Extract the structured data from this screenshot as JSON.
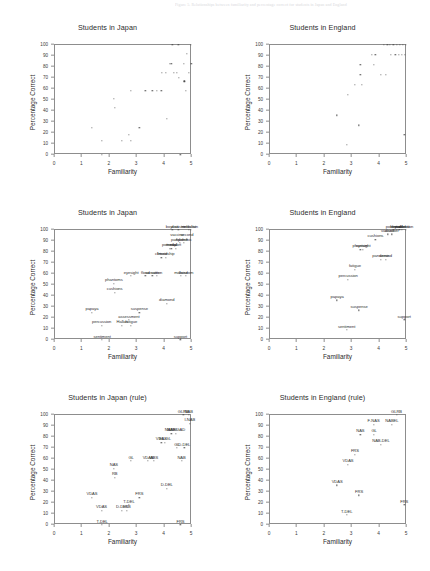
{
  "document": {
    "header_line": "Figure 5.  Relationships between familiarity and percentage correct for students in Japan and England"
  },
  "axes": {
    "xlabel": "Familiarity",
    "ylabel": "Percentage Correct",
    "xticks": [
      "0",
      "1",
      "2",
      "3",
      "4",
      "5"
    ],
    "yticks": [
      "0",
      "10",
      "20",
      "30",
      "40",
      "50",
      "60",
      "70",
      "80",
      "90",
      "100"
    ],
    "xlim": [
      0,
      5
    ],
    "ylim": [
      0,
      100
    ]
  },
  "chart_data": [
    {
      "id": "japan-plain",
      "type": "scatter",
      "title": "Students in Japan",
      "xlabel": "Familiarity",
      "ylabel": "Percentage Correct",
      "xlim": [
        0,
        5
      ],
      "ylim": [
        0,
        100
      ],
      "grid": false,
      "points": [
        {
          "x": 1.35,
          "y": 25
        },
        {
          "x": 1.7,
          "y": 13
        },
        {
          "x": 1.72,
          "y": 0
        },
        {
          "x": 2.15,
          "y": 51
        },
        {
          "x": 2.18,
          "y": 43
        },
        {
          "x": 2.45,
          "y": 13
        },
        {
          "x": 2.7,
          "y": 18
        },
        {
          "x": 2.78,
          "y": 13
        },
        {
          "x": 2.78,
          "y": 58
        },
        {
          "x": 3.08,
          "y": 25
        },
        {
          "x": 3.3,
          "y": 58
        },
        {
          "x": 3.55,
          "y": 58
        },
        {
          "x": 3.72,
          "y": 58
        },
        {
          "x": 3.88,
          "y": 58
        },
        {
          "x": 3.9,
          "y": 75
        },
        {
          "x": 4.05,
          "y": 75
        },
        {
          "x": 4.08,
          "y": 33
        },
        {
          "x": 4.18,
          "y": 83
        },
        {
          "x": 4.25,
          "y": 83
        },
        {
          "x": 4.28,
          "y": 100
        },
        {
          "x": 4.35,
          "y": 75
        },
        {
          "x": 4.45,
          "y": 75
        },
        {
          "x": 4.5,
          "y": 100
        },
        {
          "x": 4.52,
          "y": 70
        },
        {
          "x": 4.58,
          "y": 0
        },
        {
          "x": 4.7,
          "y": 83
        },
        {
          "x": 4.72,
          "y": 67
        },
        {
          "x": 4.78,
          "y": 58
        },
        {
          "x": 4.82,
          "y": 92
        },
        {
          "x": 4.88,
          "y": 75
        },
        {
          "x": 4.95,
          "y": 100
        },
        {
          "x": 4.98,
          "y": 83
        }
      ]
    },
    {
      "id": "england-plain",
      "type": "scatter",
      "title": "Students in England",
      "xlabel": "Familiarity",
      "ylabel": "Percentage Correct",
      "xlim": [
        0,
        5
      ],
      "ylim": [
        0,
        100
      ],
      "grid": false,
      "points": [
        {
          "x": 2.45,
          "y": 36
        },
        {
          "x": 2.8,
          "y": 9
        },
        {
          "x": 2.85,
          "y": 55
        },
        {
          "x": 3.1,
          "y": 64
        },
        {
          "x": 3.25,
          "y": 27
        },
        {
          "x": 3.3,
          "y": 82
        },
        {
          "x": 3.3,
          "y": 73
        },
        {
          "x": 3.35,
          "y": 64
        },
        {
          "x": 3.72,
          "y": 91
        },
        {
          "x": 3.78,
          "y": 82
        },
        {
          "x": 3.85,
          "y": 91
        },
        {
          "x": 4.05,
          "y": 73
        },
        {
          "x": 4.15,
          "y": 100
        },
        {
          "x": 4.22,
          "y": 73
        },
        {
          "x": 4.28,
          "y": 100
        },
        {
          "x": 4.38,
          "y": 100
        },
        {
          "x": 4.42,
          "y": 91
        },
        {
          "x": 4.5,
          "y": 100
        },
        {
          "x": 4.58,
          "y": 91
        },
        {
          "x": 4.62,
          "y": 100
        },
        {
          "x": 4.7,
          "y": 91
        },
        {
          "x": 4.75,
          "y": 100
        },
        {
          "x": 4.8,
          "y": 91
        },
        {
          "x": 4.85,
          "y": 100
        },
        {
          "x": 4.9,
          "y": 18
        },
        {
          "x": 4.92,
          "y": 91
        },
        {
          "x": 4.96,
          "y": 100
        }
      ]
    },
    {
      "id": "japan-words",
      "type": "scatter",
      "title": "Students in Japan",
      "xlabel": "Familiarity",
      "ylabel": "Percentage Correct",
      "xlim": [
        0,
        5
      ],
      "ylim": [
        0,
        100
      ],
      "grid": false,
      "points": [
        {
          "x": 1.35,
          "y": 25,
          "label": "papaya"
        },
        {
          "x": 1.7,
          "y": 13,
          "label": "percussion"
        },
        {
          "x": 1.72,
          "y": 0,
          "label": "sentiment"
        },
        {
          "x": 2.15,
          "y": 51,
          "label": "phantoms"
        },
        {
          "x": 2.18,
          "y": 43,
          "label": "cushions"
        },
        {
          "x": 2.45,
          "y": 13,
          "label": "Hallari"
        },
        {
          "x": 2.7,
          "y": 18,
          "label": "assessment"
        },
        {
          "x": 2.78,
          "y": 13,
          "label": "fatigue"
        },
        {
          "x": 2.78,
          "y": 58,
          "label": "eyesight"
        },
        {
          "x": 3.08,
          "y": 25,
          "label": "suspense"
        },
        {
          "x": 3.3,
          "y": 58,
          "label": "flood"
        },
        {
          "x": 3.55,
          "y": 58,
          "label": "sweater"
        },
        {
          "x": 3.72,
          "y": 58,
          "label": "cotton"
        },
        {
          "x": 3.88,
          "y": 75,
          "label": "climate"
        },
        {
          "x": 4.05,
          "y": 75,
          "label": "friendship"
        },
        {
          "x": 4.08,
          "y": 33,
          "label": "diamond"
        },
        {
          "x": 4.18,
          "y": 83,
          "label": "potential"
        },
        {
          "x": 4.25,
          "y": 83,
          "label": "medal"
        },
        {
          "x": 4.28,
          "y": 100,
          "label": "boycott"
        },
        {
          "x": 4.4,
          "y": 83,
          "label": "export"
        },
        {
          "x": 4.45,
          "y": 92,
          "label": "vaccine"
        },
        {
          "x": 4.5,
          "y": 100,
          "label": "disaster"
        },
        {
          "x": 4.55,
          "y": 88,
          "label": "pandemic"
        },
        {
          "x": 4.58,
          "y": 0,
          "label": "support"
        },
        {
          "x": 4.6,
          "y": 58,
          "label": "malaise"
        },
        {
          "x": 4.7,
          "y": 88,
          "label": "epidemic"
        },
        {
          "x": 4.78,
          "y": 58,
          "label": "freedom"
        },
        {
          "x": 4.82,
          "y": 92,
          "label": "second"
        },
        {
          "x": 4.88,
          "y": 100,
          "label": "medalist"
        },
        {
          "x": 4.95,
          "y": 100,
          "label": "infection"
        }
      ]
    },
    {
      "id": "england-words",
      "type": "scatter",
      "title": "Students in England",
      "xlabel": "Familiarity",
      "ylabel": "Percentage Correct",
      "xlim": [
        0,
        5
      ],
      "ylim": [
        0,
        100
      ],
      "grid": false,
      "points": [
        {
          "x": 2.45,
          "y": 36,
          "label": "papaya"
        },
        {
          "x": 2.8,
          "y": 9,
          "label": "sentiment"
        },
        {
          "x": 2.85,
          "y": 55,
          "label": "percussion"
        },
        {
          "x": 3.1,
          "y": 64,
          "label": "fatigue"
        },
        {
          "x": 3.25,
          "y": 27,
          "label": "suspense"
        },
        {
          "x": 3.3,
          "y": 82,
          "label": "phantom"
        },
        {
          "x": 3.4,
          "y": 82,
          "label": "eyesight"
        },
        {
          "x": 3.85,
          "y": 91,
          "label": "cushions"
        },
        {
          "x": 4.05,
          "y": 73,
          "label": "pandemic"
        },
        {
          "x": 4.22,
          "y": 73,
          "label": "second"
        },
        {
          "x": 4.3,
          "y": 96,
          "label": "vaccine"
        },
        {
          "x": 4.45,
          "y": 96,
          "label": "disaster"
        },
        {
          "x": 4.5,
          "y": 100,
          "label": "potential"
        },
        {
          "x": 4.62,
          "y": 100,
          "label": "boycott"
        },
        {
          "x": 4.72,
          "y": 100,
          "label": "freedom"
        },
        {
          "x": 4.82,
          "y": 100,
          "label": "medalist"
        },
        {
          "x": 4.9,
          "y": 18,
          "label": "support"
        },
        {
          "x": 4.96,
          "y": 100,
          "label": "infection"
        }
      ]
    },
    {
      "id": "japan-rules",
      "type": "scatter",
      "title": "Students in Japan (rule)",
      "xlabel": "Familiarity",
      "ylabel": "Percentage Correct",
      "xlim": [
        0,
        5
      ],
      "ylim": [
        0,
        100
      ],
      "grid": false,
      "points": [
        {
          "x": 1.35,
          "y": 25,
          "label": "VDAS"
        },
        {
          "x": 1.7,
          "y": 13,
          "label": "VDAS"
        },
        {
          "x": 1.72,
          "y": 0,
          "label": "T-DEL"
        },
        {
          "x": 2.15,
          "y": 51,
          "label": "NAS"
        },
        {
          "x": 2.18,
          "y": 43,
          "label": "RB"
        },
        {
          "x": 2.45,
          "y": 13,
          "label": "D-DEL"
        },
        {
          "x": 2.62,
          "y": 13,
          "label": "I-RB"
        },
        {
          "x": 2.7,
          "y": 18,
          "label": "T-DEL"
        },
        {
          "x": 2.78,
          "y": 58,
          "label": "GL"
        },
        {
          "x": 3.08,
          "y": 25,
          "label": "FRS"
        },
        {
          "x": 3.4,
          "y": 58,
          "label": "VDAS"
        },
        {
          "x": 3.62,
          "y": 58,
          "label": "ABS"
        },
        {
          "x": 3.88,
          "y": 75,
          "label": "VDAS"
        },
        {
          "x": 4.02,
          "y": 75,
          "label": "EL-GL"
        },
        {
          "x": 4.08,
          "y": 33,
          "label": "D-DEL"
        },
        {
          "x": 4.25,
          "y": 83,
          "label": "NABEL"
        },
        {
          "x": 4.42,
          "y": 83,
          "label": "NAB/GAD"
        },
        {
          "x": 4.45,
          "y": 70,
          "label": "GL"
        },
        {
          "x": 4.58,
          "y": 0,
          "label": "FRS"
        },
        {
          "x": 4.62,
          "y": 58,
          "label": "NAB"
        },
        {
          "x": 4.68,
          "y": 100,
          "label": "GLRB"
        },
        {
          "x": 4.72,
          "y": 70,
          "label": "D-DEL"
        },
        {
          "x": 4.88,
          "y": 100,
          "label": "NAB"
        },
        {
          "x": 4.92,
          "y": 92,
          "label": "I-NAB"
        }
      ]
    },
    {
      "id": "england-rules",
      "type": "scatter",
      "title": "Students in England (rule)",
      "xlabel": "Familiarity",
      "ylabel": "Percentage Correct",
      "xlim": [
        0,
        5
      ],
      "ylim": [
        0,
        100
      ],
      "grid": false,
      "points": [
        {
          "x": 2.45,
          "y": 36,
          "label": "VDAS"
        },
        {
          "x": 2.8,
          "y": 9,
          "label": "T-DEL"
        },
        {
          "x": 2.85,
          "y": 55,
          "label": "VDAS"
        },
        {
          "x": 3.1,
          "y": 64,
          "label": "FRS"
        },
        {
          "x": 3.25,
          "y": 27,
          "label": "FRS"
        },
        {
          "x": 3.3,
          "y": 82,
          "label": "NAS"
        },
        {
          "x": 3.78,
          "y": 91,
          "label": "F-NAS"
        },
        {
          "x": 3.8,
          "y": 82,
          "label": "GL"
        },
        {
          "x": 4.05,
          "y": 73,
          "label": "NAB-DEL"
        },
        {
          "x": 4.45,
          "y": 91,
          "label": "NABEL"
        },
        {
          "x": 4.62,
          "y": 100,
          "label": "GLRB"
        },
        {
          "x": 4.9,
          "y": 18,
          "label": "FRS"
        }
      ]
    }
  ]
}
